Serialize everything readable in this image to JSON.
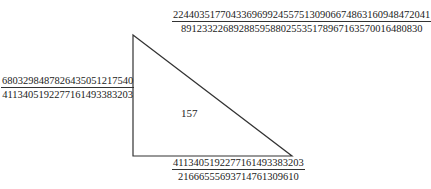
{
  "diagram": {
    "type": "right-triangle",
    "area_label": "157",
    "hypotenuse": {
      "numerator": "2244035177043369699245575130906674863160948472041",
      "denominator": "8912332268928859588025535178967163570016480830"
    },
    "vertical_leg": {
      "numerator": "6803298487826435051217540",
      "denominator": "4113405192277161493383203"
    },
    "horizontal_leg": {
      "numerator": "4113405192277161493383203",
      "denominator": "21666555693714761309610"
    },
    "stroke_color": "#333333"
  }
}
